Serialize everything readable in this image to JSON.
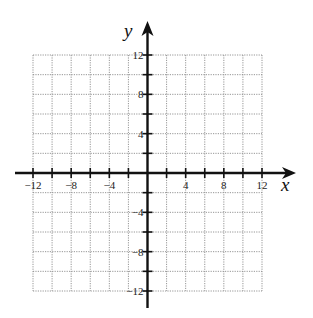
{
  "chart_data": {
    "type": "scatter",
    "title": "",
    "xlabel": "x",
    "ylabel": "y",
    "xlim": [
      -12,
      12
    ],
    "ylim": [
      -12,
      12
    ],
    "grid": true,
    "grid_step": 2,
    "grid_style": "dotted",
    "x_ticks": [
      -12,
      -10,
      -8,
      -6,
      -4,
      -2,
      2,
      4,
      6,
      8,
      10,
      12
    ],
    "y_ticks": [
      -12,
      -10,
      -8,
      -6,
      -4,
      -2,
      2,
      4,
      6,
      8,
      10,
      12
    ],
    "x_tick_labels": [
      {
        "value": -12,
        "label": "−12"
      },
      {
        "value": -8,
        "label": "−8"
      },
      {
        "value": -4,
        "label": "−4"
      },
      {
        "value": 4,
        "label": "4"
      },
      {
        "value": 8,
        "label": "8"
      },
      {
        "value": 12,
        "label": "12"
      }
    ],
    "y_tick_labels": [
      {
        "value": 12,
        "label": "12"
      },
      {
        "value": 8,
        "label": "8"
      },
      {
        "value": 4,
        "label": "4"
      },
      {
        "value": -4,
        "label": "−4"
      },
      {
        "value": -8,
        "label": "−8"
      },
      {
        "value": -12,
        "label": "−12"
      }
    ],
    "series": [],
    "colors": {
      "axis": "#111111",
      "grid": "#8a8a8a",
      "text": "#222222"
    }
  }
}
